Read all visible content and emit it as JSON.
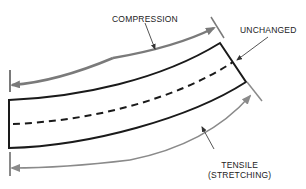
{
  "diagram": {
    "type": "beam-bending-stress",
    "labels": {
      "compression": "COMPRESSION",
      "unchanged": "UNCHANGED",
      "tensile_line1": "TENSILE",
      "tensile_line2": "(STRETCHING)"
    },
    "colors": {
      "beam": "#1a1a1a",
      "compression_arrow": "#7a7a7a",
      "tension_arrow": "#8a8a8a",
      "leader": "#555555",
      "text": "#222222"
    }
  }
}
